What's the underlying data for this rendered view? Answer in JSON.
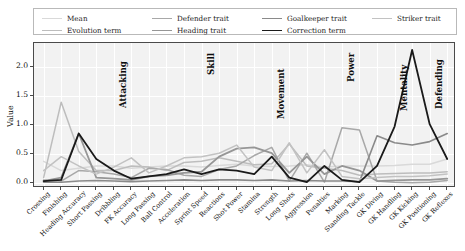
{
  "legend": {
    "entries": [
      {
        "label": "Mean",
        "color": "#d9d9d9",
        "width": 1.5,
        "row": 0,
        "col": 0
      },
      {
        "label": "Defender trait",
        "color": "#a8a8a8",
        "width": 1.5,
        "row": 0,
        "col": 1
      },
      {
        "label": "Goalkeeper trait",
        "color": "#8a8a8a",
        "width": 1.5,
        "row": 0,
        "col": 2
      },
      {
        "label": "Striker trait",
        "color": "#c2c2c2",
        "width": 1.5,
        "row": 0,
        "col": 3
      },
      {
        "label": "Evolution term",
        "color": "#bdbdbd",
        "width": 1.5,
        "row": 1,
        "col": 0
      },
      {
        "label": "Heading trait",
        "color": "#969696",
        "width": 1.8,
        "row": 1,
        "col": 1
      },
      {
        "label": "Correction term",
        "color": "#1a1a1a",
        "width": 1.8,
        "row": 1,
        "col": 2
      }
    ]
  },
  "axes": {
    "ylabel": "Value",
    "yticks": [
      "0.0",
      "0.5",
      "1.0",
      "1.5",
      "2.0"
    ],
    "ytick_values": [
      0.0,
      0.5,
      1.0,
      1.5,
      2.0
    ],
    "ylim": [
      -0.08,
      2.42
    ],
    "xlabel": "",
    "grid": true,
    "background": "#f2f2f2"
  },
  "groups": [
    {
      "label": "Attacking",
      "start": 0,
      "end": 4
    },
    {
      "label": "Skill",
      "start": 5,
      "end": 9
    },
    {
      "label": "Movement",
      "start": 10,
      "end": 13
    },
    {
      "label": "Power",
      "start": 14,
      "end": 17
    },
    {
      "label": "Mentality",
      "start": 18,
      "end": 20
    },
    {
      "label": "Defending",
      "start": 21,
      "end": 22
    },
    {
      "label": "Goalkeeping",
      "start": 23,
      "end": 27
    }
  ],
  "chart_data": {
    "type": "line",
    "title": "",
    "xlabel": "",
    "ylabel": "Value",
    "ylim": [
      -0.08,
      2.42
    ],
    "grid": true,
    "legend_position": "top",
    "categories": [
      "Crossing",
      "Finishing",
      "Heading Accuracy",
      "Short Passing",
      "Dribbling",
      "FK Accuracy",
      "Long Passing",
      "Ball Control",
      "Acceleration",
      "Sprint Speed",
      "Reactions",
      "Shot Power",
      "Stamina",
      "Strength",
      "Long Shots",
      "Aggression",
      "Penalties",
      "Marking",
      "Standing Tackle",
      "GK Diving",
      "GK Handling",
      "GK Kicking",
      "GK Positioning",
      "GK Reflexes"
    ],
    "series": [
      {
        "name": "Mean",
        "color": "#d9d9d9",
        "width": 1.5,
        "values": [
          0.38,
          0.22,
          0.26,
          0.3,
          0.3,
          0.26,
          0.28,
          0.3,
          0.3,
          0.28,
          0.31,
          0.33,
          0.3,
          0.29,
          0.3,
          0.32,
          0.28,
          0.3,
          0.3,
          0.3,
          0.31,
          0.33,
          0.33,
          0.42
        ]
      },
      {
        "name": "Evolution term",
        "color": "#bdbdbd",
        "width": 1.5,
        "values": [
          0.1,
          1.4,
          0.55,
          0.22,
          0.22,
          0.3,
          0.28,
          0.22,
          0.36,
          0.38,
          0.44,
          0.38,
          0.32,
          0.34,
          0.68,
          0.3,
          0.26,
          0.22,
          0.14,
          0.16,
          0.17,
          0.18,
          0.18,
          0.2
        ]
      },
      {
        "name": "Defender trait",
        "color": "#a8a8a8",
        "width": 1.5,
        "values": [
          0.06,
          0.04,
          0.22,
          0.2,
          0.16,
          0.1,
          0.26,
          0.24,
          0.14,
          0.12,
          0.24,
          0.3,
          0.48,
          0.62,
          0.04,
          0.52,
          0.02,
          0.96,
          0.92,
          0.04,
          0.02,
          0.01,
          0.02,
          0.05
        ]
      },
      {
        "name": "Heading trait",
        "color": "#969696",
        "width": 1.8,
        "values": [
          0.04,
          0.1,
          0.86,
          0.1,
          0.08,
          0.06,
          0.12,
          0.14,
          0.18,
          0.2,
          0.46,
          0.6,
          0.62,
          0.52,
          0.18,
          0.46,
          0.16,
          0.3,
          0.22,
          0.04,
          0.05,
          0.06,
          0.06,
          0.08
        ]
      },
      {
        "name": "Goalkeeper trait",
        "color": "#8a8a8a",
        "width": 1.6,
        "values": [
          0.02,
          0.02,
          0.04,
          0.05,
          0.04,
          0.03,
          0.04,
          0.05,
          0.06,
          0.05,
          0.06,
          0.06,
          0.05,
          0.06,
          0.04,
          0.05,
          0.04,
          0.04,
          0.03,
          0.82,
          0.7,
          0.66,
          0.72,
          0.86
        ]
      },
      {
        "name": "Striker trait",
        "color": "#c2c2c2",
        "width": 1.5,
        "values": [
          0.22,
          0.46,
          0.3,
          0.16,
          0.28,
          0.44,
          0.18,
          0.3,
          0.44,
          0.46,
          0.52,
          0.66,
          0.28,
          0.22,
          0.7,
          0.18,
          0.58,
          0.12,
          0.08,
          0.1,
          0.12,
          0.12,
          0.13,
          0.16
        ]
      },
      {
        "name": "Correction term",
        "color": "#1a1a1a",
        "width": 1.8,
        "values": [
          0.04,
          0.06,
          0.86,
          0.42,
          0.22,
          0.08,
          0.12,
          0.16,
          0.24,
          0.16,
          0.24,
          0.22,
          0.16,
          0.46,
          0.1,
          0.02,
          0.3,
          0.06,
          0.02,
          0.3,
          0.98,
          2.3,
          1.02,
          0.42
        ]
      }
    ]
  }
}
